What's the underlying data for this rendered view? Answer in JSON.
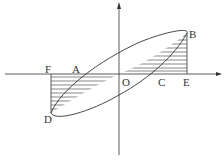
{
  "diagram": {
    "type": "hysteresis-loop",
    "labels": {
      "A": "A",
      "B": "B",
      "C": "C",
      "D": "D",
      "E": "E",
      "F": "F",
      "O": "O"
    },
    "colors": {
      "stroke": "#333333",
      "background": "#ffffff"
    }
  }
}
